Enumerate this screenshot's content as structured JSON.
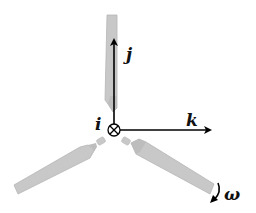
{
  "diagram": {
    "title": "",
    "colors": {
      "background": "#ffffff",
      "blade_fill": "#c8c8c8",
      "blade_stroke": "#b0b0b0",
      "axis": "#000000"
    },
    "axes": {
      "i": {
        "label": "i",
        "direction": "into-page"
      },
      "j": {
        "label": "j",
        "direction": "up"
      },
      "k": {
        "label": "k",
        "direction": "right"
      }
    },
    "rotation": {
      "label": "ω"
    },
    "blades": [
      {
        "name": "top-blade"
      },
      {
        "name": "lower-left-blade"
      },
      {
        "name": "lower-right-blade"
      }
    ]
  }
}
